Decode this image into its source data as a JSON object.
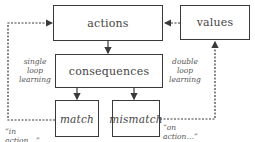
{
  "diagram": {
    "nodes": {
      "actions": "actions",
      "values": "values",
      "consequences": "consequences",
      "match": "match",
      "mismatch": "mismatch"
    },
    "annotations": {
      "single_loop": [
        "single",
        "loop",
        "learning"
      ],
      "double_loop": [
        "double",
        "loop",
        "learning"
      ],
      "in_action": "“in action…”",
      "on_action": "“on action…”"
    },
    "edges": [
      {
        "from": "actions",
        "to": "consequences",
        "style": "solid"
      },
      {
        "from": "consequences",
        "to": "match",
        "style": "solid"
      },
      {
        "from": "consequences",
        "to": "mismatch",
        "style": "solid"
      },
      {
        "from": "values",
        "to": "actions",
        "style": "dashed"
      },
      {
        "from": "match",
        "to": "actions",
        "style": "dashed",
        "label": "in action"
      },
      {
        "from": "mismatch",
        "to": "values",
        "style": "dashed",
        "label": "on action"
      }
    ],
    "colors": {
      "line": "#3a3a3a",
      "text": "#444444",
      "background": "#ffffff"
    }
  }
}
